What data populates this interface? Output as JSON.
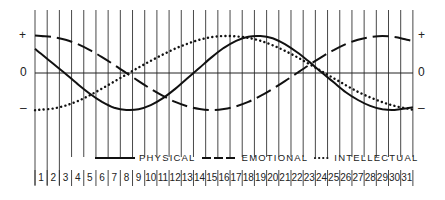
{
  "chart_data": {
    "type": "line",
    "title": "",
    "xlabel": "",
    "ylabel": "",
    "y_tick_labels": [
      "+",
      "0",
      "–"
    ],
    "ylim": [
      -1,
      1
    ],
    "grid": true,
    "legend_position": "bottom",
    "x": [
      1,
      2,
      3,
      4,
      5,
      6,
      7,
      8,
      9,
      10,
      11,
      12,
      13,
      14,
      15,
      16,
      17,
      18,
      19,
      20,
      21,
      22,
      23,
      24,
      25,
      26,
      27,
      28,
      29,
      30,
      31
    ],
    "series": [
      {
        "name": "PHYSICAL",
        "style": "solid",
        "period_days": 23,
        "values": [
          0.52,
          0.25,
          -0.02,
          -0.3,
          -0.56,
          -0.78,
          -0.94,
          -1.0,
          -0.98,
          -0.87,
          -0.68,
          -0.43,
          -0.14,
          0.14,
          0.43,
          0.68,
          0.87,
          0.98,
          1.0,
          0.94,
          0.78,
          0.56,
          0.3,
          0.02,
          -0.25,
          -0.52,
          -0.73,
          -0.89,
          -0.98,
          -1.0,
          -0.95
        ]
      },
      {
        "name": "EMOTIONAL",
        "style": "dashed",
        "period_days": 28,
        "values": [
          1.0,
          0.97,
          0.9,
          0.78,
          0.62,
          0.43,
          0.22,
          0.0,
          -0.22,
          -0.43,
          -0.62,
          -0.78,
          -0.9,
          -0.97,
          -1.0,
          -0.97,
          -0.9,
          -0.78,
          -0.62,
          -0.43,
          -0.22,
          0.0,
          0.22,
          0.43,
          0.62,
          0.78,
          0.9,
          0.97,
          1.0,
          0.97,
          0.9
        ]
      },
      {
        "name": "INTELLECTUAL",
        "style": "dotted",
        "period_days": 33,
        "values": [
          -0.99,
          -0.96,
          -0.88,
          -0.76,
          -0.6,
          -0.42,
          -0.23,
          -0.04,
          0.15,
          0.33,
          0.5,
          0.66,
          0.79,
          0.9,
          0.97,
          1.0,
          0.99,
          0.95,
          0.87,
          0.75,
          0.6,
          0.43,
          0.24,
          0.05,
          -0.14,
          -0.33,
          -0.51,
          -0.66,
          -0.79,
          -0.89,
          -0.96
        ]
      }
    ]
  },
  "axis": {
    "plus_left": "+",
    "zero_left": "0",
    "minus_left": "–",
    "plus_right": "+",
    "zero_right": "0",
    "minus_right": "–"
  },
  "legend": {
    "physical": "PHYSICAL",
    "emotional": "EMOTIONAL",
    "intellectual": "INTELLECTUAL"
  },
  "days": [
    "1",
    "2",
    "3",
    "4",
    "5",
    "6",
    "7",
    "8",
    "9",
    "10",
    "11",
    "12",
    "13",
    "14",
    "15",
    "16",
    "17",
    "18",
    "19",
    "20",
    "21",
    "22",
    "23",
    "24",
    "25",
    "26",
    "27",
    "28",
    "29",
    "30",
    "31"
  ]
}
